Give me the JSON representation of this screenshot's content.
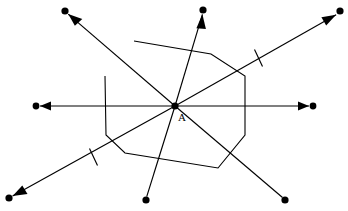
{
  "figure": {
    "background_color": "#ffffff",
    "stroke_color": "#000000",
    "width": 348,
    "height": 211,
    "center_point": {
      "label": "A",
      "x": 175,
      "y": 106,
      "label_x": 178,
      "label_y": 121,
      "dot_radius": 3.6
    },
    "rays": [
      {
        "name": "ray-left",
        "direction": "west",
        "endpoint_x": 36,
        "endpoint_y": 106,
        "dot_radius": 3.4,
        "has_arrow": true,
        "has_tick": false
      },
      {
        "name": "ray-right",
        "direction": "east",
        "endpoint_x": 313,
        "endpoint_y": 106,
        "dot_radius": 3.4,
        "has_arrow": true,
        "has_tick": false
      },
      {
        "name": "ray-upper-left",
        "direction": "northwest",
        "endpoint_x": 65,
        "endpoint_y": 11,
        "dot_radius": 3.6,
        "has_arrow": true,
        "has_tick": false
      },
      {
        "name": "ray-lower-right",
        "direction": "southeast",
        "endpoint_x": 285,
        "endpoint_y": 200,
        "dot_radius": 3.6,
        "has_arrow": false,
        "has_tick": false
      },
      {
        "name": "ray-upper-right",
        "direction": "northeast",
        "endpoint_x": 340,
        "endpoint_y": 11,
        "dot_radius": 3.6,
        "has_arrow": true,
        "has_tick": true,
        "tick_x": 258,
        "tick_y": 58
      },
      {
        "name": "ray-lower-left",
        "direction": "southwest",
        "endpoint_x": 9,
        "endpoint_y": 198,
        "dot_radius": 3.6,
        "has_arrow": true,
        "has_tick": true,
        "tick_x": 93,
        "tick_y": 156
      },
      {
        "name": "ray-up",
        "direction": "north",
        "endpoint_x": 203,
        "endpoint_y": 10,
        "dot_radius": 3.6,
        "has_arrow": true,
        "has_tick": false
      },
      {
        "name": "ray-down",
        "direction": "south",
        "endpoint_x": 146,
        "endpoint_y": 200,
        "dot_radius": 3.6,
        "has_arrow": false,
        "has_tick": false
      }
    ],
    "polygon": {
      "name": "heptagon",
      "vertex_count": 7,
      "points": "134,41 211,54 245,76 245,135 218,168 125,153 106,135 105,76"
    }
  }
}
